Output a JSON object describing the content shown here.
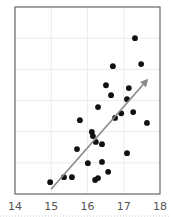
{
  "chart_data": {
    "type": "scatter",
    "title": "",
    "xlabel": "",
    "ylabel": "",
    "xlim": [
      14,
      18
    ],
    "ylim": [
      0,
      6
    ],
    "x_ticks": [
      14,
      15,
      16,
      17,
      18
    ],
    "x_tick_labels": [
      "14",
      "15",
      "16",
      "17",
      "18"
    ],
    "y_ticks": [],
    "grid": true,
    "legend": null,
    "series": [
      {
        "name": "points",
        "points": [
          {
            "x": 17.31,
            "y": 5.0
          },
          {
            "x": 16.7,
            "y": 4.1
          },
          {
            "x": 17.48,
            "y": 4.17
          },
          {
            "x": 16.51,
            "y": 3.49
          },
          {
            "x": 16.65,
            "y": 3.17
          },
          {
            "x": 17.14,
            "y": 3.4
          },
          {
            "x": 17.09,
            "y": 3.04
          },
          {
            "x": 16.29,
            "y": 2.79
          },
          {
            "x": 16.93,
            "y": 2.59
          },
          {
            "x": 17.26,
            "y": 2.63
          },
          {
            "x": 16.76,
            "y": 2.44
          },
          {
            "x": 15.79,
            "y": 2.37
          },
          {
            "x": 17.64,
            "y": 2.28
          },
          {
            "x": 16.12,
            "y": 1.99
          },
          {
            "x": 16.15,
            "y": 1.86
          },
          {
            "x": 16.23,
            "y": 1.67
          },
          {
            "x": 16.4,
            "y": 1.6
          },
          {
            "x": 15.71,
            "y": 1.44
          },
          {
            "x": 17.09,
            "y": 1.31
          },
          {
            "x": 16.01,
            "y": 0.99
          },
          {
            "x": 16.4,
            "y": 1.03
          },
          {
            "x": 16.57,
            "y": 0.71
          },
          {
            "x": 15.35,
            "y": 0.54
          },
          {
            "x": 15.57,
            "y": 0.54
          },
          {
            "x": 16.29,
            "y": 0.51
          },
          {
            "x": 16.21,
            "y": 0.45
          },
          {
            "x": 14.97,
            "y": 0.38
          }
        ]
      }
    ],
    "annotations": [
      {
        "type": "arrow",
        "from": {
          "x": 15.0,
          "y": 0.16
        },
        "to": {
          "x": 17.64,
          "y": 3.65
        },
        "color": "#888888"
      }
    ]
  },
  "colors": {
    "point": "#111111",
    "arrow": "#8a8a8a",
    "frame": "#666666",
    "grid": "#ececec",
    "tick_text": "#555555"
  }
}
